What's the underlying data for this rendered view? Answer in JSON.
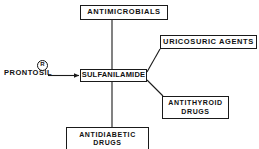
{
  "diagram": {
    "type": "radial-node-link",
    "stroke_color": "#1a1a1a",
    "text_color": "#111111",
    "background_color": "#ffffff",
    "source": {
      "label": "PRONTOSIL",
      "trademark_symbol": "R",
      "name": "prontosil-source-label"
    },
    "center": {
      "label": "SULFANILAMIDE"
    },
    "branches": [
      {
        "label": "ANTIMICROBIALS",
        "line2": "",
        "direction": "up"
      },
      {
        "label": "URICOSURIC  AGENTS",
        "line2": "",
        "direction": "upper-right"
      },
      {
        "label": "ANTITHYROID",
        "line2": "DRUGS",
        "direction": "lower-right"
      },
      {
        "label": "ANTIDIABETIC",
        "line2": "DRUGS",
        "direction": "down"
      }
    ]
  }
}
